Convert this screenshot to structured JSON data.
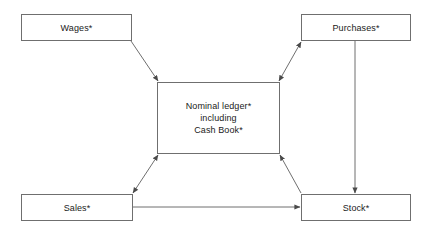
{
  "diagram": {
    "background_color": "#ffffff",
    "line_color": "#6f6f6f",
    "text_color": "#1a1a1a",
    "nodes": [
      {
        "id": "wages",
        "label": "Wages*"
      },
      {
        "id": "purchases",
        "label": "Purchases*"
      },
      {
        "id": "nominal",
        "label": "Nominal ledger*\ninclusion"
      },
      {
        "id": "sales",
        "label": "Sales*"
      },
      {
        "id": "stock",
        "label": "Stock*"
      }
    ],
    "nominal_lines": {
      "line1": "Nominal ledger*",
      "line2": "including",
      "line3": "Cash Book*"
    },
    "labels": {
      "wages": "Wages*",
      "purchases": "Purchases*",
      "sales": "Sales*",
      "stock": "Stock*"
    },
    "connectors": [
      {
        "id": "wages-to-nominal",
        "from": "wages",
        "to": "nominal",
        "arrowheads": "single"
      },
      {
        "id": "nominal-to-purchases",
        "from": "nominal",
        "to": "purchases",
        "arrowheads": "double"
      },
      {
        "id": "sales-to-nominal",
        "from": "sales",
        "to": "nominal",
        "arrowheads": "double"
      },
      {
        "id": "stock-to-nominal",
        "from": "stock",
        "to": "nominal",
        "arrowheads": "single"
      },
      {
        "id": "purchases-to-stock",
        "from": "purchases",
        "to": "stock",
        "arrowheads": "single"
      },
      {
        "id": "sales-to-stock",
        "from": "sales",
        "to": "stock",
        "arrowheads": "single"
      }
    ]
  }
}
